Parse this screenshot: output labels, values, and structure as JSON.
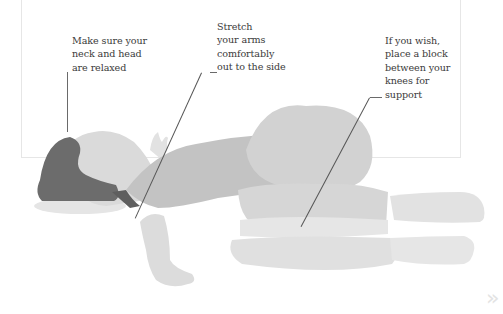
{
  "captions": {
    "neck": "Make sure your\nneck and head\nare relaxed",
    "arms": "Stretch\nyour arms\ncomfortably\nout to the side",
    "knees": "If you wish,\nplace a block\nbetween your\nknees for\nsupport"
  },
  "nav": {
    "next_icon": "»"
  },
  "colors": {
    "hair": "#6b6b6b",
    "skin": "#d2d2d2",
    "torso": "#c1c1c1",
    "legs": "#d4d4d4",
    "block": "#e2e2e2",
    "pillow": "#e4e4e4",
    "text": "#3a3a3a",
    "leader": "#555555",
    "frame": "#e4e4e4"
  }
}
